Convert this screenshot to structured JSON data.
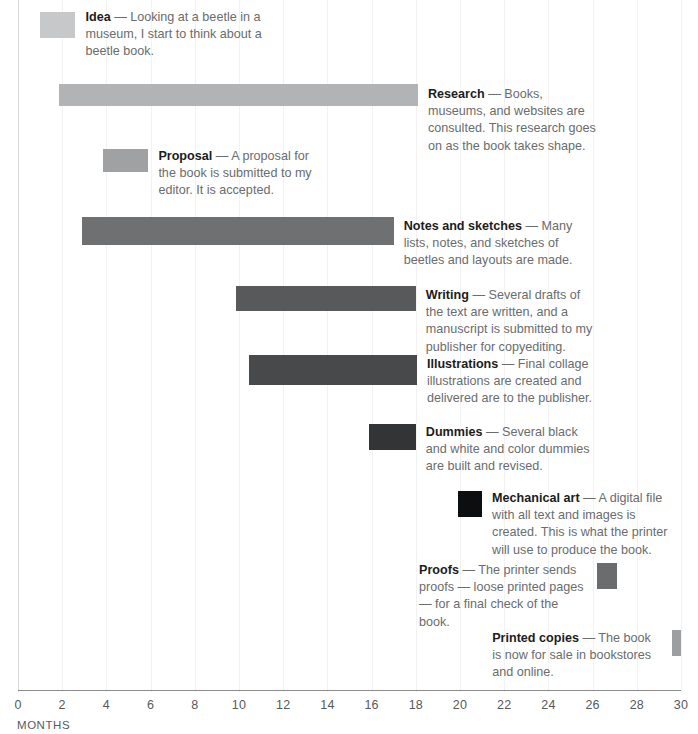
{
  "chart_data": {
    "type": "bar",
    "orientation": "horizontal",
    "title": "",
    "subtitle": "",
    "xlabel": "MONTHS",
    "ylabel": "",
    "xlim": [
      0,
      30
    ],
    "grid": true,
    "legend": "none",
    "tick_labels": [
      "0",
      "2",
      "4",
      "6",
      "8",
      "10",
      "12",
      "14",
      "16",
      "18",
      "20",
      "22",
      "24",
      "26",
      "28",
      "30"
    ],
    "tick_values": [
      0,
      2,
      4,
      6,
      8,
      10,
      12,
      14,
      16,
      18,
      20,
      22,
      24,
      26,
      28,
      30
    ],
    "categories": [
      "Idea",
      "Research",
      "Proposal",
      "Notes and sketches",
      "Writing",
      "Illustrations",
      "Dummies",
      "Mechanical art",
      "Proofs",
      "Printed copies"
    ],
    "series": [
      {
        "name": "Duration (months)",
        "start": [
          1.0,
          1.85,
          3.85,
          2.9,
          9.85,
          10.45,
          15.9,
          19.9,
          26.2,
          29.6
        ],
        "end": [
          2.6,
          18.1,
          5.9,
          17.0,
          18.0,
          18.05,
          18.0,
          21.0,
          27.1,
          30.0
        ],
        "values": [
          1.6,
          16.25,
          2.05,
          14.1,
          8.15,
          7.6,
          2.1,
          1.1,
          0.9,
          0.4
        ]
      }
    ]
  },
  "axis": {
    "title": "MONTHS",
    "origin_value": "0",
    "max_value": "30"
  },
  "tasks": [
    {
      "id": "idea",
      "label": "Idea",
      "dash": " — ",
      "description": "Looking at a beetle in a museum, I start to think about a beetle book.",
      "start": 1.0,
      "end": 2.6,
      "color": "#c7c8c9",
      "text_side": "right"
    },
    {
      "id": "research",
      "label": "Research",
      "dash": " — ",
      "description": "Books, museums, and websites are consulted. This research goes on as the book takes shape.",
      "start": 1.85,
      "end": 18.1,
      "color": "#b2b3b4",
      "text_side": "right"
    },
    {
      "id": "proposal",
      "label": "Proposal",
      "dash": " — ",
      "description": "A proposal for the book is submitted to my editor. It is accepted.",
      "start": 3.85,
      "end": 5.9,
      "color": "#a0a1a2",
      "text_side": "right"
    },
    {
      "id": "notes-and-sketches",
      "label": "Notes and sketches",
      "dash": " — ",
      "description": "Many lists, notes, and sketches of beetles and layouts are made.",
      "start": 2.9,
      "end": 17.0,
      "color": "#6f7072",
      "text_side": "right"
    },
    {
      "id": "writing",
      "label": "Writing",
      "dash": " — ",
      "description": "Several drafts of the text are written, and a manuscript is submitted to my publisher for copyediting.",
      "start": 9.85,
      "end": 18.0,
      "color": "#58595b",
      "text_side": "right"
    },
    {
      "id": "illustrations",
      "label": "Illustrations",
      "dash": " — ",
      "description": "Final collage illustrations are created and delivered are to the publisher.",
      "start": 10.45,
      "end": 18.05,
      "color": "#48494b",
      "text_side": "right"
    },
    {
      "id": "dummies",
      "label": "Dummies",
      "dash": " — ",
      "description": "Several black and white and color dummies are built and revised.",
      "start": 15.9,
      "end": 18.0,
      "color": "#333436",
      "text_side": "right"
    },
    {
      "id": "mechanical-art",
      "label": "Mechanical art",
      "dash": " — ",
      "description": "A digital file with all text and images is created. This is what the printer will use to produce the book.",
      "start": 19.9,
      "end": 21.0,
      "color": "#0d0e0f",
      "text_side": "right"
    },
    {
      "id": "proofs",
      "label": "Proofs",
      "dash": "  — ",
      "description": "The printer sends proofs — loose printed pages — for a final check of the book.",
      "start": 26.2,
      "end": 27.1,
      "color": "#6b6c6e",
      "text_side": "left"
    },
    {
      "id": "printed-copies",
      "label": "Printed copies",
      "dash": " — ",
      "description": "The book is now for sale in bookstores and online.",
      "start": 29.6,
      "end": 30.0,
      "color": "#9d9e9f",
      "text_side": "left"
    }
  ]
}
